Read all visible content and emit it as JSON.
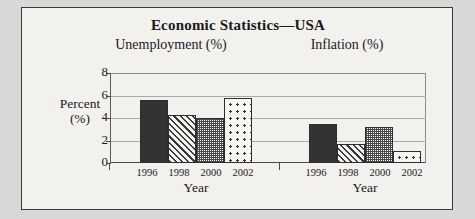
{
  "chart_data": {
    "type": "bar",
    "title": "Economic Statistics—USA",
    "panels": [
      {
        "name": "unemployment",
        "subtitle": "Unemployment (%)",
        "xlabel": "Year",
        "categories": [
          "1996",
          "1998",
          "2000",
          "2002"
        ],
        "values": [
          5.6,
          4.3,
          4.0,
          5.8
        ],
        "patterns": [
          "solid",
          "diagonal-hatch",
          "checker",
          "dots"
        ]
      },
      {
        "name": "inflation",
        "subtitle": "Inflation (%)",
        "xlabel": "Year",
        "categories": [
          "1996",
          "1998",
          "2000",
          "2002"
        ],
        "values": [
          3.5,
          1.7,
          3.2,
          1.1
        ],
        "patterns": [
          "solid",
          "diagonal-hatch",
          "checker",
          "dots"
        ]
      }
    ],
    "ylabel": "Percent",
    "ylabel_unit": "(%)",
    "yticks": [
      "0",
      "2",
      "4",
      "6",
      "8"
    ],
    "ylim": [
      0,
      8
    ],
    "grid": true,
    "legend": "none",
    "colors": {
      "bar_solid": "#333333",
      "bar_outline": "#2e2e2e",
      "background": "#f2f1ee",
      "border": "#3a3a3a",
      "gridline": "#a9a9a9",
      "text": "#1a1a1a"
    }
  }
}
